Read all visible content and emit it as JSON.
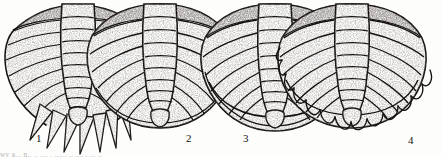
{
  "figure": {
    "kind": "scientific-illustration",
    "technique": "pen-and-ink stipple line drawing",
    "background_color": "#fdfdfc",
    "ink_color": "#14110f",
    "stipple_color": "#4a4441",
    "cut_off_top": true,
    "caption_sliver_text": "wy a... n.. .. ....  . ......  ..  ....  . ... .."
  },
  "specimens": [
    {
      "number": "1",
      "label": "1",
      "label_x": 36,
      "label_y": 133,
      "center_x": 78,
      "axial_rings": 10,
      "pleural_ribs": 8,
      "margin": "long free pleural spines, fan of pointed tips",
      "marginal_spines": 9,
      "description": "Pygidium with long radiating pointed pleural spines projecting well beyond the axis; axial lobe narrow and strongly tapered."
    },
    {
      "number": "2",
      "label": "2",
      "label_x": 186,
      "label_y": 133,
      "center_x": 160,
      "axial_rings": 10,
      "pleural_ribs": 9,
      "margin": "smooth rounded entire border",
      "marginal_spines": 0,
      "description": "Pygidium with broadly rounded, entire (unspined) margin; pleural ribs curve back and fuse at the border."
    },
    {
      "number": "3",
      "label": "3",
      "label_x": 243,
      "label_y": 133,
      "center_x": 275,
      "axial_rings": 10,
      "pleural_ribs": 9,
      "margin": "wide flattened border rim, entire",
      "marginal_spines": 0,
      "description": "Pygidium with a broad flattened marginal border separating the rib tips from the outer edge."
    },
    {
      "number": "4",
      "label": "4",
      "label_x": 408,
      "label_y": 135,
      "center_x": 352,
      "axial_rings": 10,
      "pleural_ribs": 9,
      "margin": "denticulate, marginal spine row",
      "marginal_spines": 11,
      "description": "Pygidium with a continuous row of short triangular marginal denticles fringing the posterior border."
    }
  ]
}
